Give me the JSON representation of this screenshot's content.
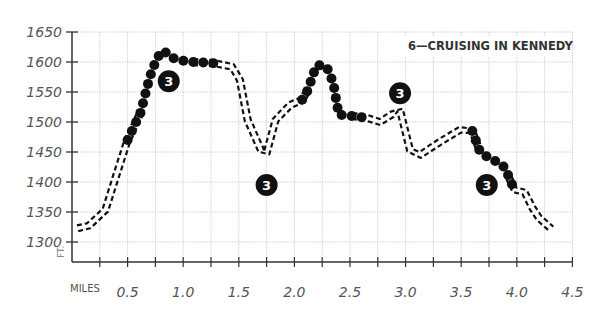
{
  "chart_data": {
    "type": "line",
    "title": "6—CRUISING IN KENNEDY",
    "xlabel": "MILES",
    "ylabel": "FT.",
    "xlim": [
      0,
      4.5
    ],
    "ylim": [
      1300,
      1650
    ],
    "grid": true,
    "x_ticks": [
      "0.5",
      "1.0",
      "1.5",
      "2.0",
      "2.5",
      "3.0",
      "3.5",
      "4.0",
      "4.5"
    ],
    "y_ticks": [
      "1650",
      "1600",
      "1550",
      "1500",
      "1450",
      "1400",
      "1350",
      "1300"
    ],
    "series": [
      {
        "name": "elevation profile",
        "x": [
          0.05,
          0.15,
          0.3,
          0.4,
          0.5,
          0.62,
          0.65,
          0.7,
          0.75,
          0.8,
          0.83,
          0.9,
          1.0,
          1.09,
          1.28,
          1.44,
          1.51,
          1.58,
          1.7,
          1.75,
          1.83,
          1.96,
          2.07,
          2.12,
          2.18,
          2.21,
          2.29,
          2.35,
          2.38,
          2.4,
          2.52,
          2.65,
          2.77,
          2.88,
          2.95,
          3.04,
          3.13,
          3.31,
          3.49,
          3.6,
          3.67,
          3.75,
          3.83,
          3.9,
          3.93,
          3.98,
          4.07,
          4.14,
          4.2,
          4.31
        ],
        "y": [
          1323,
          1327,
          1353,
          1412,
          1470,
          1517,
          1540,
          1575,
          1600,
          1617,
          1618,
          1607,
          1602,
          1600,
          1598,
          1592,
          1570,
          1503,
          1453,
          1448,
          1503,
          1528,
          1537,
          1553,
          1585,
          1595,
          1592,
          1565,
          1532,
          1512,
          1510,
          1507,
          1500,
          1513,
          1520,
          1453,
          1445,
          1467,
          1487,
          1485,
          1450,
          1440,
          1433,
          1423,
          1407,
          1387,
          1383,
          1357,
          1340,
          1322
        ]
      }
    ],
    "difficulty_segments": [
      {
        "label": "3",
        "style": "dots",
        "x_range": [
          0.6,
          1.1
        ],
        "marker_at": [
          0.87,
          1568
        ]
      },
      {
        "label": "3",
        "style": "dots",
        "x_range": [
          2.1,
          2.55
        ],
        "marker_at": [
          1.75,
          1395
        ]
      },
      {
        "label": "3",
        "style": "dashed",
        "x_range": [
          2.55,
          3.0
        ],
        "marker_at": [
          2.95,
          1548
        ]
      },
      {
        "label": "3",
        "style": "dots",
        "x_range": [
          3.67,
          3.95
        ],
        "marker_at": [
          3.73,
          1395
        ]
      }
    ],
    "annotations": [
      "3",
      "3",
      "3",
      "3"
    ]
  },
  "labels": {
    "title": "6—CRUISING IN KENNEDY",
    "x_axis": "MILES",
    "y_axis": "FT.",
    "badge": "3"
  }
}
